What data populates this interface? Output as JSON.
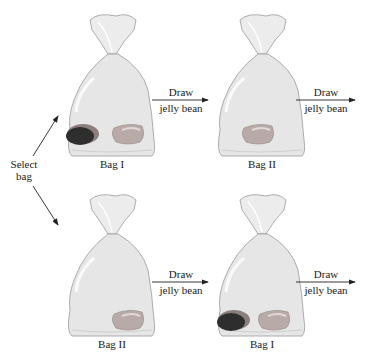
{
  "figure": {
    "select_label_line1": "Select",
    "select_label_line2": "bag",
    "draw_label_line1": "Draw",
    "draw_label_line2": "jelly bean",
    "rows": [
      {
        "first_bag": {
          "name": "Bag I",
          "beans": [
            "dark",
            "red"
          ]
        },
        "second_bag": {
          "name": "Bag II",
          "beans": [
            "red"
          ]
        }
      },
      {
        "first_bag": {
          "name": "Bag II",
          "beans": [
            "red"
          ]
        },
        "second_bag": {
          "name": "Bag I",
          "beans": [
            "dark",
            "red"
          ]
        }
      }
    ],
    "colors": {
      "bag_fill": "#e6e6e6",
      "bag_stroke": "#9a9a9a",
      "bean_dark": "#2e2e2e",
      "bean_red": "#b8aaa6",
      "ribbon": "#a0a0a0",
      "line": "#222222"
    }
  }
}
